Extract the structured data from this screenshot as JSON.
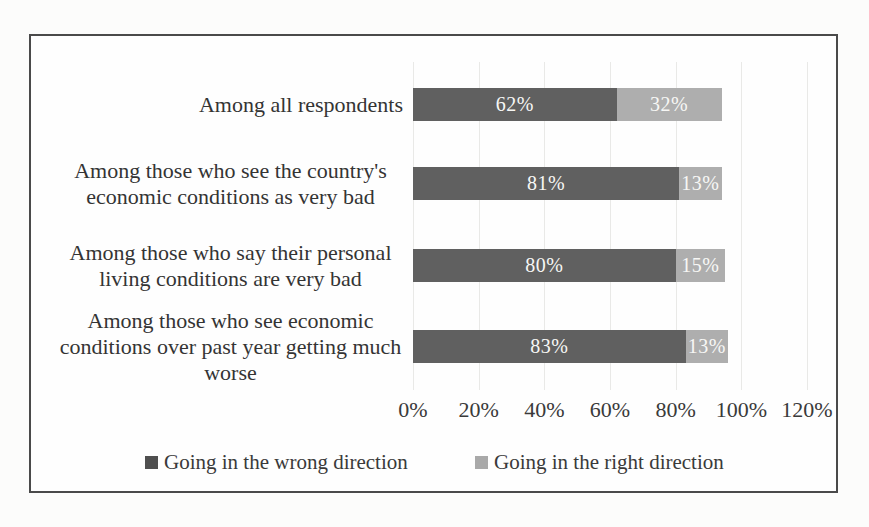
{
  "page": {
    "background_color": "#fcfcfb",
    "frame_border_color": "#4a4a4a"
  },
  "chart_data": {
    "type": "bar",
    "orientation": "horizontal",
    "stacked": true,
    "title": "",
    "categories": [
      "Among all respondents",
      "Among those who see the country's economic conditions as very bad",
      "Among those who say their personal living conditions are very bad",
      "Among those who see economic conditions over past year getting much worse"
    ],
    "series": [
      {
        "name": "Going in the wrong direction",
        "values": [
          62,
          81,
          80,
          83
        ],
        "color": "#606060",
        "legend_swatch_color": "#4f4f4f"
      },
      {
        "name": "Going in the right direction",
        "values": [
          32,
          13,
          15,
          13
        ],
        "color": "#aeaeae",
        "legend_swatch_color": "#a9a9a9"
      }
    ],
    "value_suffix": "%",
    "data_label_color": "#f7f7f5",
    "x_ticks": [
      "0%",
      "20%",
      "40%",
      "60%",
      "80%",
      "100%",
      "120%"
    ],
    "xlim": [
      0,
      120
    ],
    "grid": "vertical-light",
    "gridline_color": "#e9e9e7",
    "legend_position": "bottom"
  }
}
